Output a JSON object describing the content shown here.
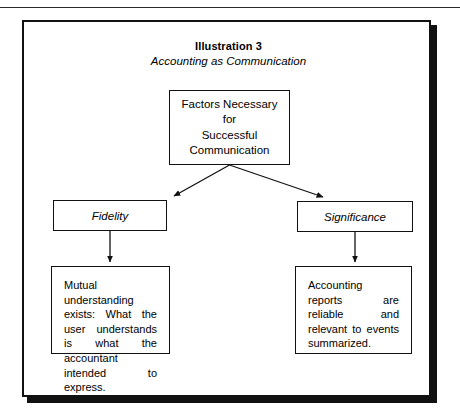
{
  "figure": {
    "title": "Illustration 3",
    "subtitle": "Accounting as Communication"
  },
  "diagram": {
    "root": {
      "label": "Factors Necessary\nfor\nSuccessful\nCommunication"
    },
    "branches": [
      {
        "heading": "Fidelity",
        "detail": "Mutual understanding exists: What the user understands is what the accountant intended to express."
      },
      {
        "heading": "Significance",
        "detail": "Accounting reports are reliable and relevant to events summarized."
      }
    ]
  },
  "colors": {
    "ink": "#111111",
    "page": "#ffffff"
  }
}
